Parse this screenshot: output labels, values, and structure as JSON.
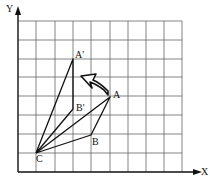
{
  "diagram": {
    "axes": {
      "x_label": "X",
      "y_label": "Y"
    },
    "points": {
      "C": {
        "label": "C",
        "px": [
          36,
          153
        ]
      },
      "B": {
        "label": "B",
        "px": [
          91,
          135
        ]
      },
      "A": {
        "label": "A",
        "px": [
          110,
          97
        ]
      },
      "A_prime": {
        "label": "A'",
        "px": [
          73,
          59
        ]
      },
      "B_prime": {
        "label": "B'",
        "px": [
          73,
          109
        ]
      }
    },
    "rotation_arrow": "curved-arrow-counterclockwise",
    "colors": {
      "line": "#111111",
      "grid": "#555555",
      "background": "#ffffff"
    }
  }
}
